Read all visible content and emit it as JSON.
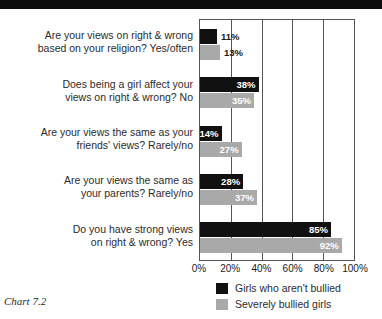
{
  "title_bar": {
    "text": "Comparison of right & wrong views among bullied girls"
  },
  "caption": "Chart 7.2",
  "legend": {
    "items": [
      {
        "label": "Girls who aren't bullied",
        "color": "#111111"
      },
      {
        "label": "Severely bullied girls",
        "color": "#a9a9a9"
      }
    ]
  },
  "chart_data": {
    "type": "bar",
    "orientation": "horizontal",
    "title": "",
    "xlabel": "",
    "ylabel": "",
    "xlim": [
      0,
      100
    ],
    "xticks": [
      "0%",
      "20%",
      "40%",
      "60%",
      "80%",
      "100%"
    ],
    "xtick_values": [
      0,
      20,
      40,
      60,
      80,
      100
    ],
    "grid": true,
    "legend_position": "bottom",
    "categories": [
      "Are your views on right & wrong based on your religion? Yes/often",
      "Does being a girl affect your views on right & wrong? No",
      "Are your views the same as your friends' views? Rarely/no",
      "Are your views the same as your parents? Rarely/no",
      "Do you have strong views on right & wrong? Yes"
    ],
    "category_lines": [
      [
        "Are your views on right & wrong",
        "based on your religion? Yes/often"
      ],
      [
        "Does being a girl affect your",
        "views on right & wrong? No"
      ],
      [
        "Are your views the same as your",
        "friends' views? Rarely/no"
      ],
      [
        "Are your views the same as",
        "your parents? Rarely/no"
      ],
      [
        "Do you have strong views",
        "on right & wrong? Yes"
      ]
    ],
    "series": [
      {
        "name": "Girls who aren't bullied",
        "color": "#111111",
        "values": [
          11,
          38,
          14,
          28,
          85
        ],
        "labels": [
          "11%",
          "38%",
          "14%",
          "28%",
          "85%"
        ],
        "label_placement": [
          "outside",
          "inside",
          "inside",
          "inside",
          "inside"
        ]
      },
      {
        "name": "Severely bullied girls",
        "color": "#a9a9a9",
        "values": [
          13,
          35,
          27,
          37,
          92
        ],
        "labels": [
          "13%",
          "35%",
          "27%",
          "37%",
          "92%"
        ],
        "label_placement": [
          "outside",
          "inside",
          "inside",
          "inside",
          "inside"
        ]
      }
    ]
  }
}
